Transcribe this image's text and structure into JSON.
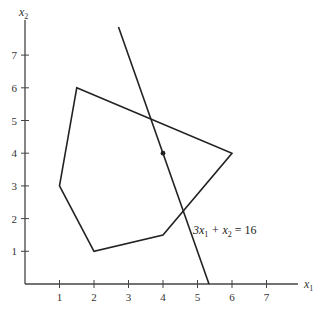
{
  "diagram": {
    "type": "linear-programming-feasible-region",
    "axes": {
      "x_label": "x",
      "x_label_sub": "1",
      "y_label": "x",
      "y_label_sub": "2",
      "x_ticks": [
        "1",
        "2",
        "3",
        "4",
        "5",
        "6",
        "7"
      ],
      "y_ticks": [
        "1",
        "2",
        "3",
        "4",
        "5",
        "6",
        "7"
      ]
    },
    "polygon": {
      "vertices": [
        [
          1.5,
          6
        ],
        [
          6,
          4
        ],
        [
          4,
          1.5
        ],
        [
          2,
          1
        ],
        [
          1,
          3
        ]
      ]
    },
    "line": {
      "equation_parts": [
        "3x",
        "1",
        " + x",
        "2",
        " = 16"
      ],
      "from": [
        2.71,
        7.86
      ],
      "to": [
        5.333,
        0
      ]
    },
    "point": {
      "coords": [
        4,
        4
      ]
    },
    "colors": {
      "stroke": "#222222",
      "axis": "#444444",
      "background": "#ffffff"
    }
  }
}
